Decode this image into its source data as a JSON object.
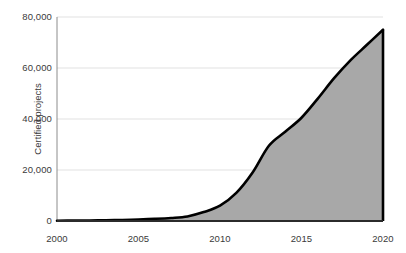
{
  "chart_data": {
    "type": "area",
    "title": "",
    "xlabel": "",
    "ylabel": "Certified projects",
    "xlim": [
      2000,
      2020
    ],
    "ylim": [
      0,
      80000
    ],
    "grid": true,
    "legend": false,
    "line_color": "#000000",
    "fill_color": "#a8a8a8",
    "gridline_color": "#d9d9d9",
    "axis_color": "#808080",
    "x": [
      2000,
      2001,
      2002,
      2003,
      2004,
      2005,
      2006,
      2007,
      2008,
      2009,
      2010,
      2011,
      2012,
      2013,
      2014,
      2015,
      2016,
      2017,
      2018,
      2019,
      2020
    ],
    "values": [
      100,
      150,
      200,
      280,
      400,
      600,
      850,
      1200,
      1800,
      3500,
      6000,
      11000,
      19000,
      29500,
      35000,
      40500,
      48000,
      56000,
      63000,
      69000,
      75000
    ],
    "ytick_values": [
      80000,
      60000,
      40000,
      20000,
      0
    ],
    "ytick_labels": [
      "80,000",
      "60,000",
      "40,000",
      "20,000",
      "0"
    ],
    "xtick_values": [
      2000,
      2005,
      2010,
      2015,
      2020
    ],
    "xtick_labels": [
      "2000",
      "2005",
      "2010",
      "2015",
      "2020"
    ]
  }
}
